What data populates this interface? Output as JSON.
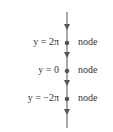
{
  "diagram": {
    "type": "phase-line",
    "line_color": "#555555",
    "equilibria": [
      {
        "label": "y = 2π",
        "kind": "node"
      },
      {
        "label": "y = 0",
        "kind": "node"
      },
      {
        "label": "y = −2π",
        "kind": "node"
      }
    ],
    "arrow_direction": "down"
  }
}
